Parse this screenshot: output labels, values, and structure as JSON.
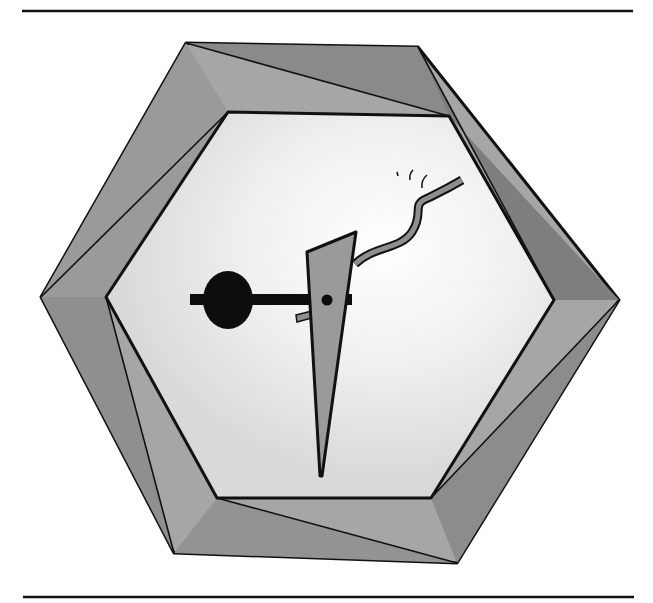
{
  "illustration": {
    "description": "Pencil-shaded hexagonal frame enclosing an abstract figure: black disc on a horizontal bar crossed by a tall gray wedge with a dot and a wavy gray ribbon",
    "colors": {
      "background": "#ffffff",
      "frame_light": "#a8a8a8",
      "frame_dark": "#7d7d7d",
      "inner_fill": "#e6e6e6",
      "outline": "#111111",
      "wedge": "#9a9a9a",
      "disc": "#0d0d0d"
    },
    "rules": {
      "top_y": 11,
      "bottom_y": 597
    }
  }
}
